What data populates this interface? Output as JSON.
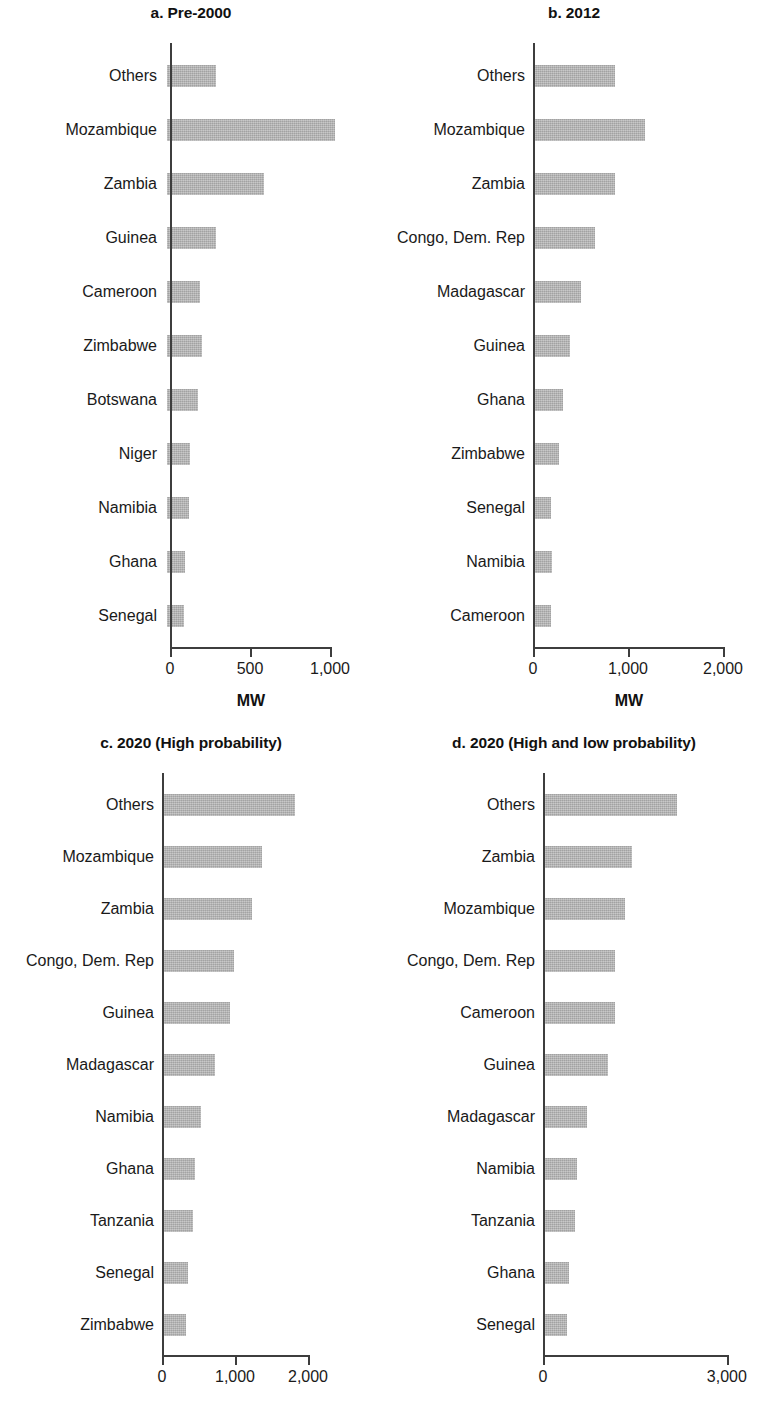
{
  "figure": {
    "axis_title": "MW",
    "bar_color": "#b3b3b3",
    "axis_color": "#3d3d3d"
  },
  "chart_data": [
    {
      "type": "bar",
      "panel_id": "a",
      "title": "a. Pre-2000",
      "orientation": "horizontal",
      "categories": [
        "Others",
        "Mozambique",
        "Zambia",
        "Guinea",
        "Cameroon",
        "Zimbabwe",
        "Botswana",
        "Niger",
        "Namibia",
        "Ghana",
        "Senegal"
      ],
      "values": [
        305,
        1050,
        605,
        305,
        205,
        220,
        195,
        145,
        135,
        110,
        105
      ],
      "xlabel": "MW",
      "ylabel": "",
      "xlim": [
        0,
        1150
      ],
      "xticks": [
        0,
        500,
        1000
      ],
      "xticklabels": [
        "0",
        "500",
        "1,000"
      ],
      "grid": false,
      "legend": false
    },
    {
      "type": "bar",
      "panel_id": "b",
      "title": "b. 2012",
      "orientation": "horizontal",
      "categories": [
        "Others",
        "Mozambique",
        "Zambia",
        "Congo, Dem. Rep",
        "Madagascar",
        "Guinea",
        "Ghana",
        "Zimbabwe",
        "Senegal",
        "Namibia",
        "Cameroon"
      ],
      "values": [
        840,
        1155,
        840,
        630,
        480,
        370,
        290,
        250,
        165,
        175,
        165
      ],
      "xlabel": "MW",
      "ylabel": "",
      "xlim": [
        0,
        2000
      ],
      "xticks": [
        0,
        1000,
        2000
      ],
      "xticklabels": [
        "0",
        "1,000",
        "2,000"
      ],
      "grid": false,
      "legend": false
    },
    {
      "type": "bar",
      "panel_id": "c",
      "title": "c. 2020 (High probability)",
      "orientation": "horizontal",
      "categories": [
        "Others",
        "Mozambique",
        "Zambia",
        "Congo, Dem. Rep",
        "Guinea",
        "Madagascar",
        "Namibia",
        "Ghana",
        "Tanzania",
        "Senegal",
        "Zimbabwe"
      ],
      "values": [
        1800,
        1340,
        1200,
        960,
        900,
        700,
        510,
        420,
        400,
        330,
        300
      ],
      "xlabel": "MW",
      "ylabel": "",
      "xlim": [
        0,
        2000
      ],
      "xticks": [
        0,
        1000,
        2000
      ],
      "xticklabels": [
        "0",
        "1,000",
        "2,000"
      ],
      "grid": false,
      "legend": false
    },
    {
      "type": "bar",
      "panel_id": "d",
      "title": "d. 2020 (High and low probability)",
      "orientation": "horizontal",
      "categories": [
        "Others",
        "Zambia",
        "Mozambique",
        "Congo, Dem. Rep",
        "Cameroon",
        "Guinea",
        "Madagascar",
        "Namibia",
        "Tanzania",
        "Ghana",
        "Senegal"
      ],
      "values": [
        2160,
        1420,
        1310,
        1150,
        1140,
        1020,
        690,
        520,
        490,
        390,
        360
      ],
      "xlabel": "MW",
      "ylabel": "",
      "xlim": [
        0,
        3000
      ],
      "xticks": [
        0,
        3000
      ],
      "xticklabels": [
        "0",
        "3,000"
      ],
      "grid": false,
      "legend": false
    }
  ]
}
